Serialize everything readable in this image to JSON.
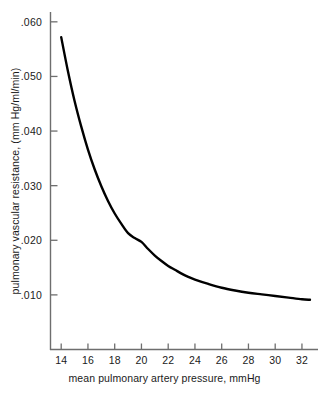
{
  "chart_data": {
    "type": "line",
    "title": "",
    "xlabel": "mean pulmonary artery pressure, mmHg",
    "ylabel": "pulmonary vascular resistance, (mm Hg/ml/min)",
    "xlim": [
      13.2,
      33.2
    ],
    "ylim": [
      0.0,
      0.0618
    ],
    "grid": false,
    "legend": null,
    "xticks": [
      14,
      16,
      18,
      20,
      22,
      24,
      26,
      28,
      30,
      32
    ],
    "xtick_labels": [
      "14",
      "16",
      "18",
      "20",
      "22",
      "24",
      "26",
      "28",
      "30",
      "32"
    ],
    "yticks": [
      0.01,
      0.02,
      0.03,
      0.04,
      0.05,
      0.06
    ],
    "ytick_labels": [
      ".010",
      ".020",
      ".030",
      ".040",
      ".050",
      ".060"
    ],
    "series": [
      {
        "name": "pulmonary vascular resistance",
        "color": "#000000",
        "x": [
          14.0,
          14.5,
          15.0,
          15.5,
          16.0,
          16.5,
          17.0,
          17.5,
          18.0,
          18.5,
          19.0,
          19.5,
          20.0,
          20.5,
          21.0,
          21.5,
          22.0,
          22.5,
          23.0,
          23.5,
          24.0,
          25.0,
          26.0,
          27.0,
          28.0,
          29.0,
          30.0,
          31.0,
          32.0,
          32.6
        ],
        "y": [
          0.0572,
          0.051,
          0.0455,
          0.0408,
          0.0366,
          0.033,
          0.0299,
          0.0272,
          0.0249,
          0.023,
          0.0213,
          0.0204,
          0.0197,
          0.0184,
          0.0172,
          0.0162,
          0.0153,
          0.0146,
          0.0139,
          0.0133,
          0.0128,
          0.012,
          0.0113,
          0.0108,
          0.0104,
          0.0101,
          0.0098,
          0.0095,
          0.0092,
          0.0091
        ]
      }
    ],
    "axis_color": "#6e6e6e",
    "tick_color": "#6e6e6e",
    "background": "#ffffff"
  }
}
